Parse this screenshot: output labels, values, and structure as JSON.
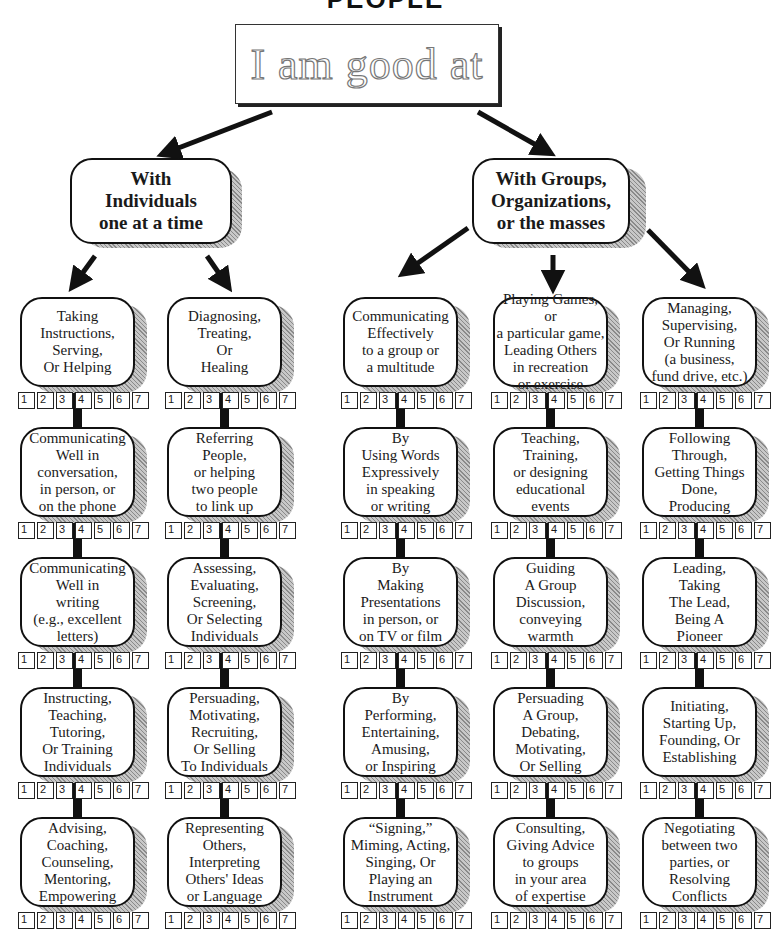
{
  "title": "PEOPLE",
  "root": {
    "label": "I am good at"
  },
  "branches": [
    {
      "label": "With\nIndividuals\none at a time"
    },
    {
      "label": "With Groups,\nOrganizations,\nor the masses"
    }
  ],
  "rating_scale": [
    "1",
    "2",
    "3",
    "4",
    "5",
    "6",
    "7"
  ],
  "columns": [
    {
      "branch": "individuals",
      "skills": [
        "Taking\nInstructions,\nServing,\nOr Helping",
        "Communicating\nWell in\nconversation,\nin person, or\non the phone",
        "Communicating\nWell in\nwriting\n(e.g., excellent\nletters)",
        "Instructing,\nTeaching,\nTutoring,\nOr Training\nIndividuals",
        "Advising,\nCoaching,\nCounseling,\nMentoring,\nEmpowering"
      ]
    },
    {
      "branch": "individuals",
      "skills": [
        "Diagnosing,\nTreating,\nOr\nHealing",
        "Referring\nPeople,\nor helping\ntwo people\nto link up",
        "Assessing,\nEvaluating,\nScreening,\nOr Selecting\nIndividuals",
        "Persuading,\nMotivating,\nRecruiting,\nOr Selling\nTo Individuals",
        "Representing\nOthers,\nInterpreting\nOthers' Ideas\nor Language"
      ]
    },
    {
      "branch": "groups",
      "skills": [
        "Communicating\nEffectively\nto a group or\na multitude",
        "By\nUsing Words\nExpressively\nin speaking\nor writing",
        "By\nMaking\nPresentations\nin person, or\non TV or film",
        "By\nPerforming,\nEntertaining,\nAmusing,\nor Inspiring",
        "“Signing,”\nMiming, Acting,\nSinging, Or\nPlaying an\nInstrument"
      ]
    },
    {
      "branch": "groups",
      "skills": [
        "Playing Games, or\na particular game,\nLeading Others\nin recreation\nor exercise",
        "Teaching,\nTraining,\nor designing\neducational\nevents",
        "Guiding\nA Group\nDiscussion,\nconveying\nwarmth",
        "Persuading\nA Group,\nDebating,\nMotivating,\nOr Selling",
        "Consulting,\nGiving Advice\nto groups\nin your area\nof expertise"
      ]
    },
    {
      "branch": "groups",
      "skills": [
        "Managing,\nSupervising,\nOr Running\n(a business,\nfund drive, etc.)",
        "Following\nThrough,\nGetting Things\nDone,\nProducing",
        "Leading,\nTaking\nThe Lead,\nBeing A\nPioneer",
        "Initiating,\nStarting Up,\nFounding, Or\nEstablishing",
        "Negotiating\nbetween two\nparties, or\nResolving\nConflicts"
      ]
    }
  ]
}
